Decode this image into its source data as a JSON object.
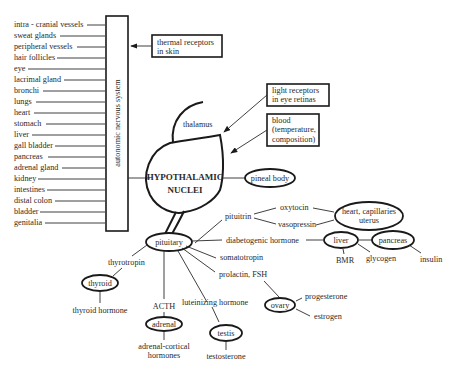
{
  "organs_list": {
    "items": [
      "intra - cranial vessels",
      "sweat glands",
      "peripheral vessels",
      "hair follicles",
      "eye",
      "lacrimal gland",
      "bronchi",
      "lungs",
      "heart",
      "stomach",
      "liver",
      "gall bladder",
      "pancreas",
      "adrenal gland",
      "kidney",
      "intestines",
      "distal colon",
      "bladder",
      "genitalia"
    ]
  },
  "ans_box": {
    "label": "autonomic nervous system"
  },
  "inputs": {
    "thermal": [
      "thermal receptors",
      "in skin"
    ],
    "light": [
      "light receptors",
      "in eye retinas"
    ],
    "blood": [
      "blood",
      "(temperature,",
      "composition)"
    ]
  },
  "center": {
    "thalamus": "thalamus",
    "hypothalamus_line1": "HYPOTHALAMIC",
    "hypothalamus_line2": "NUCLEI",
    "pineal": "pineal body"
  },
  "pituitrin_branch": {
    "pituitrin": "pituitrin",
    "oxytocin": "oxytocin",
    "vasopressin": "vasopressin",
    "target_line1": "heart, capillaries",
    "target_line2": "uterus"
  },
  "pituitary_branch": {
    "pituitary": "pituitary",
    "thyrotropin": "thyrotropin",
    "thyroid": "thyroid",
    "thyroid_hormone": "thyroid hormone",
    "acth": "ACTH",
    "adrenal": "adrenal",
    "adrenal_hormones_line1": "adrenal-cortical",
    "adrenal_hormones_line2": "hormones",
    "luteinizing": "luteinizing hormone",
    "testis": "testis",
    "testosterone": "testosterone",
    "prolactin": "prolactin, FSH",
    "ovary": "ovary",
    "progesterone": "progesterone",
    "estrogen": "estrogen",
    "somatotropin": "somatotropin",
    "diabetogenic": "diabetogenic hormone",
    "liver": "liver",
    "bmr": "BMR",
    "glycogen": "glycogen",
    "pancreas": "pancreas",
    "insulin": "insulin"
  }
}
